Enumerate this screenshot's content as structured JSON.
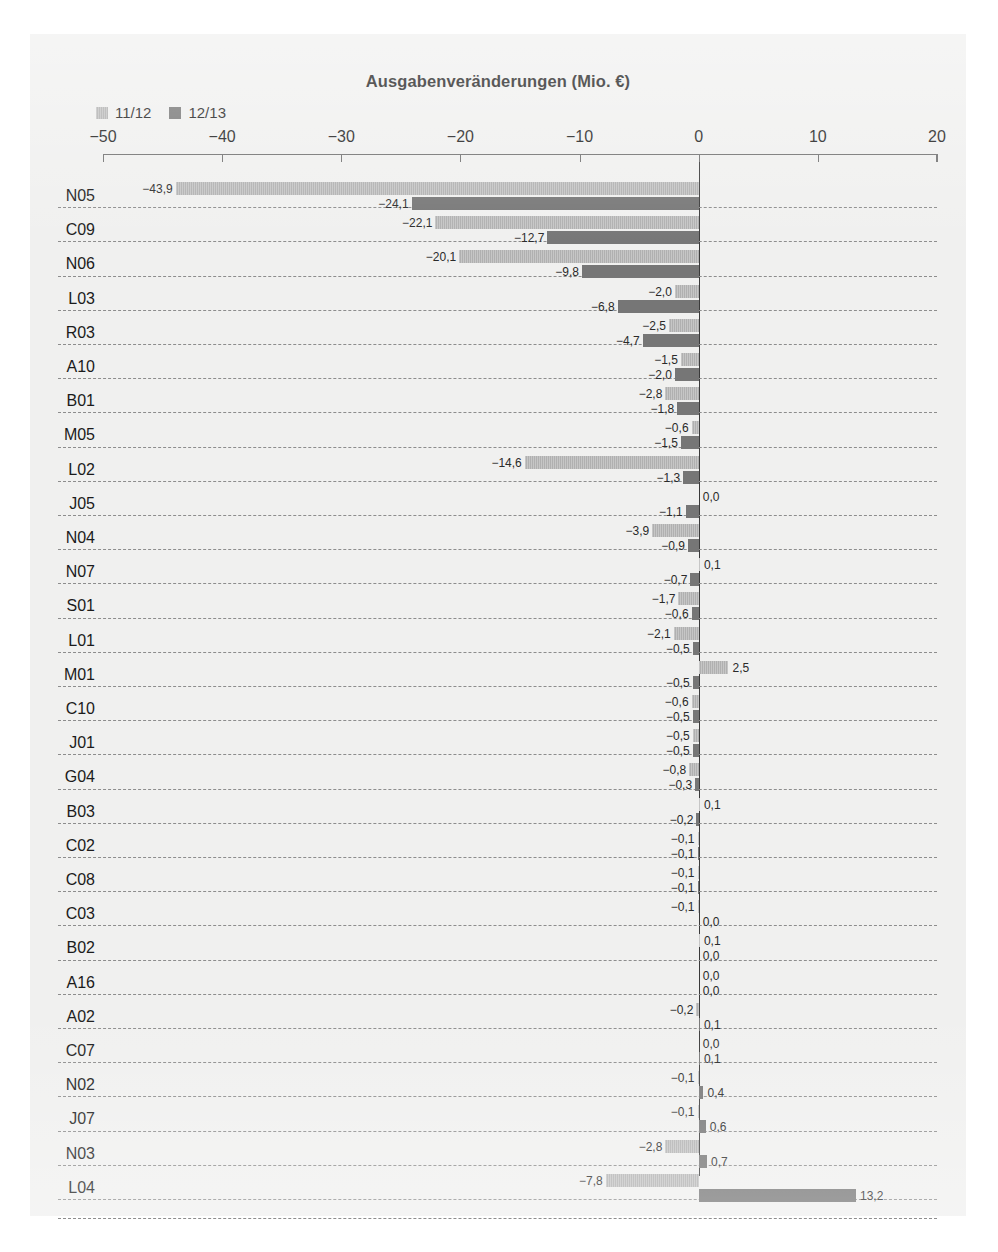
{
  "chart_data": {
    "type": "bar",
    "orientation": "horizontal",
    "title": "Ausgabenveränderungen (Mio. €)",
    "xlabel": "",
    "ylabel": "",
    "xlim": [
      -50,
      20
    ],
    "xticks": [
      -50,
      -40,
      -30,
      -20,
      -10,
      0,
      10,
      20
    ],
    "xticklabels": [
      "-50",
      "-40",
      "-30",
      "-20",
      "-10",
      "0",
      "10",
      "20"
    ],
    "grid": "horizontal-dashed",
    "legend_position": "top-left",
    "decimal_separator": ",",
    "categories": [
      "N05",
      "C09",
      "N06",
      "L03",
      "R03",
      "A10",
      "B01",
      "M05",
      "L02",
      "J05",
      "N04",
      "N07",
      "S01",
      "L01",
      "M01",
      "C10",
      "J01",
      "G04",
      "B03",
      "C02",
      "C08",
      "C03",
      "B02",
      "A16",
      "A02",
      "C07",
      "N02",
      "J07",
      "N03",
      "L04"
    ],
    "series": [
      {
        "name": "11/12",
        "color": "#bcbcbc",
        "values": [
          -43.9,
          -22.1,
          -20.1,
          -2.0,
          -2.5,
          -1.5,
          -2.8,
          -0.6,
          -14.6,
          0.0,
          -3.9,
          0.1,
          -1.7,
          -2.1,
          2.5,
          -0.6,
          -0.5,
          -0.8,
          0.1,
          -0.1,
          -0.1,
          -0.1,
          0.1,
          0.0,
          -0.2,
          0.0,
          -0.1,
          -0.1,
          -2.8,
          -7.8
        ],
        "labels": [
          "-43,9",
          "-22,1",
          "-20,1",
          "-2,0",
          "-2,5",
          "-1,5",
          "-2,8",
          "-0,6",
          "-14,6",
          "0,0",
          "-3,9",
          "0,1",
          "-1,7",
          "-2,1",
          "2,5",
          "-0,6",
          "-0,5",
          "-0,8",
          "0,1",
          "-0,1",
          "-0,1",
          "-0,1",
          "0,1",
          "0,0",
          "-0,2",
          "0,0",
          "-0,1",
          "-0,1",
          "-2,8",
          "-7,8"
        ]
      },
      {
        "name": "12/13",
        "color": "#767676",
        "values": [
          -24.1,
          -12.7,
          -9.8,
          -6.8,
          -4.7,
          -2.0,
          -1.8,
          -1.5,
          -1.3,
          -1.1,
          -0.9,
          -0.7,
          -0.6,
          -0.5,
          -0.5,
          -0.5,
          -0.5,
          -0.3,
          -0.2,
          -0.1,
          -0.1,
          0.0,
          0.0,
          0.0,
          0.1,
          0.1,
          0.4,
          0.6,
          0.7,
          13.2
        ],
        "labels": [
          "-24,1",
          "-12,7",
          "-9,8",
          "-6,8",
          "-4,7",
          "-2,0",
          "-1,8",
          "-1,5",
          "-1,3",
          "-1,1",
          "-0,9",
          "-0,7",
          "-0,6",
          "-0,5",
          "-0,5",
          "-0,5",
          "-0,5",
          "-0,3",
          "-0,2",
          "-0,1",
          "-0,1",
          "0,0",
          "0,0",
          "0,0",
          "0,1",
          "0,1",
          "0,4",
          "0,6",
          "0,7",
          "13,2"
        ]
      }
    ]
  }
}
